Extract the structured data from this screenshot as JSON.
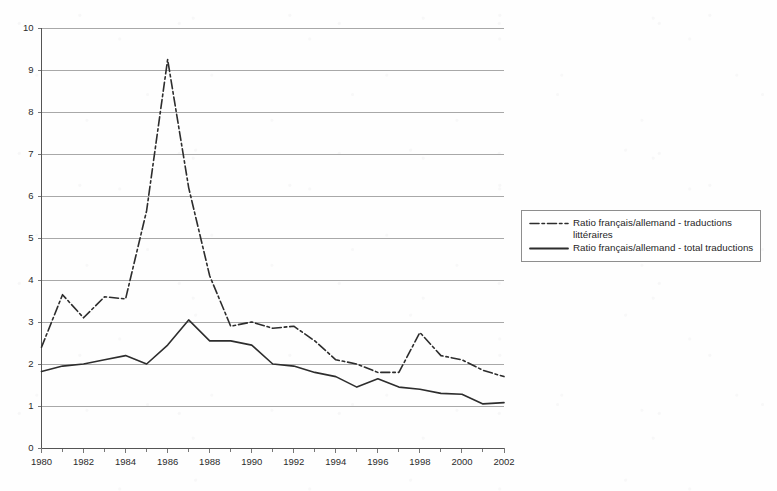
{
  "chart_data": {
    "type": "line",
    "title": "",
    "subtitle": "",
    "xlabel": "",
    "ylabel": "",
    "xlim": [
      1980,
      2002
    ],
    "ylim": [
      0,
      10
    ],
    "ytick_labels": [
      "0",
      "1",
      "2",
      "3",
      "4",
      "5",
      "6",
      "7",
      "8",
      "9",
      "10"
    ],
    "ytick_values": [
      0,
      1,
      2,
      3,
      4,
      5,
      6,
      7,
      8,
      9,
      10
    ],
    "xtick_labels": [
      "1980",
      "1982",
      "1984",
      "1986",
      "1988",
      "1990",
      "1992",
      "1994",
      "1996",
      "1998",
      "2000",
      "2002"
    ],
    "xtick_values": [
      1980,
      1982,
      1984,
      1986,
      1988,
      1990,
      1992,
      1994,
      1996,
      1998,
      2000,
      2002
    ],
    "minor_xticks": [
      1981,
      1983,
      1985,
      1987,
      1989,
      1991,
      1993,
      1995,
      1997,
      1999,
      2001
    ],
    "grid": "horizontal",
    "legend_position": "right",
    "x": [
      1980,
      1981,
      1982,
      1983,
      1984,
      1985,
      1986,
      1987,
      1988,
      1989,
      1990,
      1991,
      1992,
      1993,
      1994,
      1995,
      1996,
      1997,
      1998,
      1999,
      2000,
      2001,
      2002
    ],
    "series": [
      {
        "name": "Ratio français/allemand - traductions littéraires",
        "style": "dash-dot",
        "color": "#2d2d2d",
        "values": [
          2.4,
          3.65,
          3.1,
          3.6,
          3.55,
          5.65,
          9.25,
          6.2,
          4.1,
          2.9,
          3.0,
          2.85,
          2.9,
          2.55,
          2.1,
          2.0,
          1.8,
          1.8,
          2.75,
          2.2,
          2.1,
          1.85,
          1.7
        ]
      },
      {
        "name": "Ratio français/allemand - total traductions",
        "style": "solid",
        "color": "#2d2d2d",
        "values": [
          1.82,
          1.95,
          2.0,
          2.1,
          2.2,
          2.0,
          2.45,
          3.05,
          2.55,
          2.55,
          2.45,
          2.0,
          1.95,
          1.8,
          1.7,
          1.45,
          1.65,
          1.45,
          1.4,
          1.3,
          1.28,
          1.05,
          1.08
        ]
      }
    ]
  },
  "legend": {
    "entries": [
      {
        "label": "Ratio français/allemand - traductions\nlittéraires",
        "icon": "dash-dot-line-swatch"
      },
      {
        "label": "Ratio français/allemand - total traductions",
        "icon": "solid-line-swatch"
      }
    ]
  }
}
